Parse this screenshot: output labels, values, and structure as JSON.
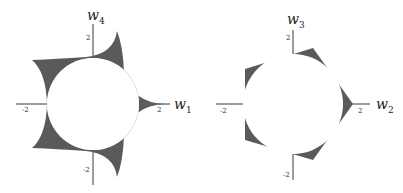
{
  "figure": {
    "panels": [
      {
        "id": "left",
        "x_axis_label": "w",
        "x_axis_sub": "1",
        "y_axis_label": "w",
        "y_axis_sub": "4",
        "ticks": {
          "x_neg": "-2",
          "x_pos": "2",
          "y_pos": "2",
          "y_neg": "-2"
        },
        "shape": "five-pointed concave star (curved spikes) surrounding unit circle, shaded region between"
      },
      {
        "id": "right",
        "x_axis_label": "w",
        "x_axis_sub": "2",
        "y_axis_label": "w",
        "y_axis_sub": "3",
        "ticks": {
          "x_neg": "-2",
          "x_pos": "2",
          "y_pos": "2",
          "y_neg": "-2"
        },
        "shape": "regular pentagon circumscribing circle, shaded region between"
      }
    ],
    "colors": {
      "fill": "#5a5a5a",
      "axis": "#555555",
      "background": "#ffffff"
    }
  }
}
